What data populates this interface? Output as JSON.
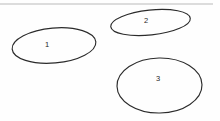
{
  "canvas": {
    "width": 220,
    "height": 121,
    "background_color": "#fefefe"
  },
  "divider": {
    "name": "top-divider",
    "color": "#b9b9b9",
    "x1": 0,
    "y1": 4,
    "x2": 213,
    "y2": 4
  },
  "chart_data": {
    "type": "diagram",
    "title": "",
    "stroke_color": "#2b2b2b",
    "label_color": "#1f1f1f",
    "shapes": [
      {
        "id": "ellipse-1",
        "label": "1",
        "cx": 54,
        "cy": 45.5,
        "rx": 42,
        "ry": 17.5,
        "rotation": -5,
        "label_x": 47,
        "label_y": 44.5
      },
      {
        "id": "ellipse-2",
        "label": "2",
        "cx": 150.5,
        "cy": 22.5,
        "rx": 40,
        "ry": 12.5,
        "rotation": -6,
        "label_x": 146,
        "label_y": 20.5
      },
      {
        "id": "ellipse-3",
        "label": "3",
        "cx": 159.5,
        "cy": 85.5,
        "rx": 42.5,
        "ry": 27.5,
        "rotation": -1,
        "label_x": 158,
        "label_y": 78.5
      }
    ]
  }
}
